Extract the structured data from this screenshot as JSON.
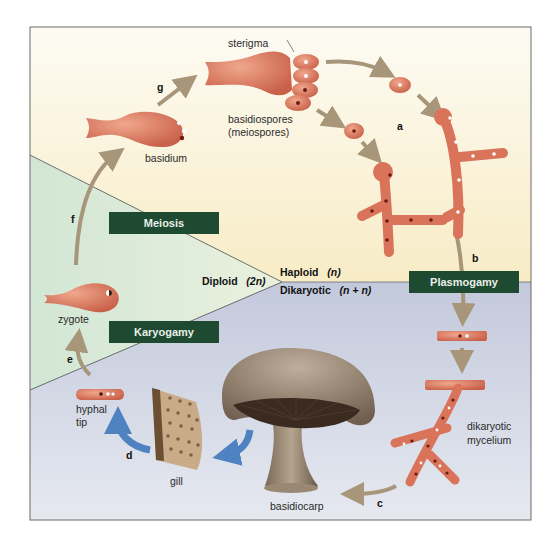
{
  "figure": {
    "colors": {
      "haploid_bg": "#fbf3dc",
      "diploid_bg": "#dcebd9",
      "dikaryotic_bg": "#c9cfe0",
      "process_box": "#1d4a30",
      "arrow": "#a8967a",
      "blue_arrow": "#4f82c1",
      "cell": "#d9735a",
      "mushroom": "#8a7866"
    }
  },
  "phases": {
    "diploid": {
      "label": "Diploid",
      "ploidy": "(2n)"
    },
    "haploid": {
      "label": "Haploid",
      "ploidy": "(n)"
    },
    "dikaryotic": {
      "label": "Dikaryotic",
      "ploidy": "(n + n)"
    }
  },
  "processes": {
    "meiosis": "Meiosis",
    "karyogamy": "Karyogamy",
    "plasmogamy": "Plasmogamy"
  },
  "labels": {
    "sterigma": "sterigma",
    "basidiospores": "basidiospores",
    "meiospores": "(meiospores)",
    "basidium": "basidium",
    "zygote": "zygote",
    "hyphal": "hyphal",
    "tip": "tip",
    "gill": "gill",
    "basidiocarp": "basidiocarp",
    "dikaryotic": "dikaryotic",
    "mycelium": "mycelium"
  },
  "steps": {
    "a": "a",
    "b": "b",
    "c": "c",
    "d": "d",
    "e": "e",
    "f": "f",
    "g": "g"
  }
}
